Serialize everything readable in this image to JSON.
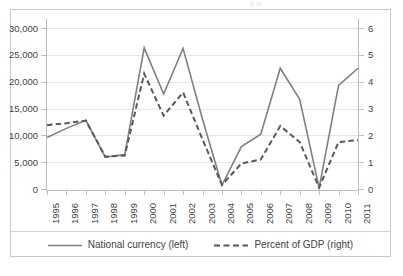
{
  "figure": {
    "background_color": "#ffffff",
    "border_color": "#c9c9c9",
    "clipped_caption": "y p"
  },
  "legend": {
    "position": "bottom-center",
    "items": [
      {
        "label": "National currency (left)",
        "style": "solid",
        "color": "#808080",
        "swatch_name": "legend-line-solid"
      },
      {
        "label": "Percent of GDP (right)",
        "style": "dashed",
        "color": "#595959",
        "swatch_name": "legend-line-dashed"
      }
    ]
  },
  "axes": {
    "left": {
      "ticks": [
        "30,000",
        "25,000",
        "20,000",
        "15,000",
        "10,000",
        "5,000",
        "0"
      ],
      "min": 0,
      "max": 30000,
      "step": 5000
    },
    "right": {
      "ticks": [
        "6",
        "5",
        "4",
        "3",
        "2",
        "1",
        "0"
      ],
      "min": 0,
      "max": 6,
      "step": 1
    },
    "x": {
      "ticks": [
        "1995",
        "1996",
        "1997",
        "1998",
        "1999",
        "2000",
        "2001",
        "2002",
        "2003",
        "2004",
        "2005",
        "2006",
        "2007",
        "2008",
        "2009",
        "2010",
        "2011"
      ]
    }
  },
  "chart_data": {
    "type": "line",
    "title": "",
    "xlabel": "",
    "ylabel": "",
    "y2label": "",
    "grid": true,
    "legend_position": "bottom",
    "x": [
      1995,
      1996,
      1997,
      1998,
      1999,
      2000,
      2001,
      2002,
      2003,
      2004,
      2005,
      2006,
      2007,
      2008,
      2009,
      2010,
      2011
    ],
    "categories": [
      "1995",
      "1996",
      "1997",
      "1998",
      "1999",
      "2000",
      "2001",
      "2002",
      "2003",
      "2004",
      "2005",
      "2006",
      "2007",
      "2008",
      "2009",
      "2010",
      "2011"
    ],
    "ylim": [
      0,
      30000
    ],
    "y2lim": [
      0,
      6
    ],
    "series": [
      {
        "name": "National currency (left)",
        "axis": "left",
        "style": "solid",
        "color": "#808080",
        "values": [
          9600,
          11300,
          12800,
          5950,
          6400,
          26300,
          17700,
          26200,
          13000,
          700,
          7900,
          10200,
          22500,
          16700,
          200,
          19300,
          22500
        ]
      },
      {
        "name": "Percent of GDP (right)",
        "axis": "right",
        "style": "dashed",
        "color": "#595959",
        "values": [
          2.38,
          2.45,
          2.55,
          1.2,
          1.25,
          4.3,
          2.73,
          3.6,
          1.85,
          0.15,
          0.95,
          1.1,
          2.35,
          1.75,
          0.05,
          1.75,
          1.82
        ]
      }
    ]
  }
}
